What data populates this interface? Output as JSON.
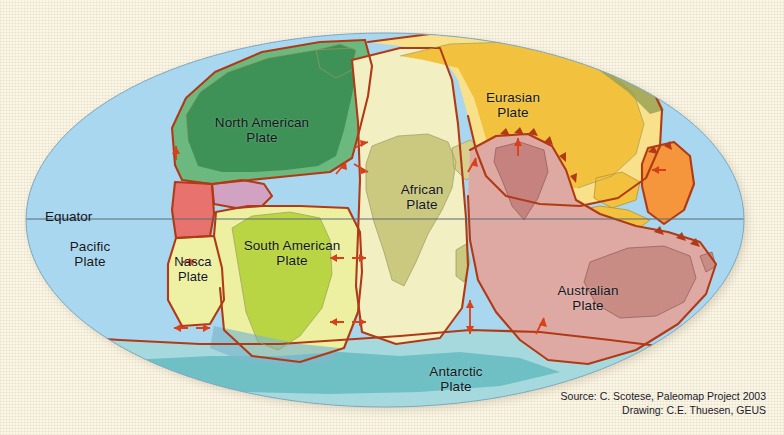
{
  "figure": {
    "type": "map",
    "projection": "Mollweide oval",
    "background_color": "#fbf6e6"
  },
  "equator": {
    "label": "Equator",
    "line_color": "#5a6a72"
  },
  "plates": [
    {
      "id": "pacific",
      "label": "Pacific\nPlate",
      "color": "#a9d7ef",
      "x": 42,
      "y": 239,
      "w": 96,
      "size": "lbl-lg"
    },
    {
      "id": "north-american",
      "label": "North American\nPlate",
      "color": "#55a86c",
      "x": 182,
      "y": 115,
      "w": 160,
      "size": "lbl-lg"
    },
    {
      "id": "eurasian",
      "label": "Eurasian\nPlate",
      "color": "#f2c23f",
      "x": 455,
      "y": 90,
      "w": 116,
      "size": "lbl-lg"
    },
    {
      "id": "african",
      "label": "African\nPlate",
      "color": "#f2efc2",
      "x": 374,
      "y": 182,
      "w": 96,
      "size": "lbl-lg"
    },
    {
      "id": "south-american",
      "label": "South American\nPlate",
      "color": "#edf0a0",
      "x": 216,
      "y": 238,
      "w": 152,
      "size": "lbl-lg"
    },
    {
      "id": "nasca",
      "label": "Nasca\nPlate",
      "color": "#eef0a4",
      "x": 160,
      "y": 255,
      "w": 66,
      "size": "lbl-md"
    },
    {
      "id": "australian",
      "label": "Australian\nPlate",
      "color": "#dfa9a3",
      "x": 531,
      "y": 283,
      "w": 114,
      "size": "lbl-lg"
    },
    {
      "id": "antarctic",
      "label": "Antarctic\nPlate",
      "color": "#a6d9de",
      "x": 400,
      "y": 364,
      "w": 112,
      "size": "lbl-lg"
    }
  ],
  "credit": {
    "line1": "Source: C. Scotese, Paleomap Project 2003",
    "line2": "Drawing: C.E. Thuesen, GEUS"
  },
  "colors": {
    "ocean_pacific": "#a9d7ef",
    "ocean_antarctic": "#a6d9de",
    "land_north_america": "#3f9257",
    "land_south_america": "#b9d544",
    "land_africa": "#cbc880",
    "land_india": "#c5827e",
    "land_australia": "#c98c85",
    "land_antarctica": "#6fc0c4",
    "plate_boundary": "#b03a16",
    "coastline": "#9a9a5e",
    "cocos": "#e8736e",
    "caribbean": "#d9a8c4",
    "philippine": "#f5953c",
    "arabian": "#d9cf8c",
    "india_plate": "#dba8a3"
  }
}
